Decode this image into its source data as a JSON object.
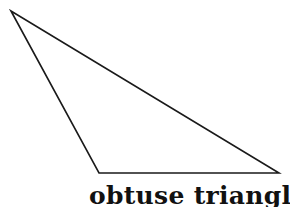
{
  "diagram": {
    "shape": "triangle",
    "type": "obtuse",
    "vertices": [
      [
        11,
        11
      ],
      [
        99,
        173
      ],
      [
        279,
        173
      ]
    ],
    "stroke_color": "#1a1a1a",
    "fill_color": "#ffffff"
  },
  "caption": "obtuse triangle"
}
